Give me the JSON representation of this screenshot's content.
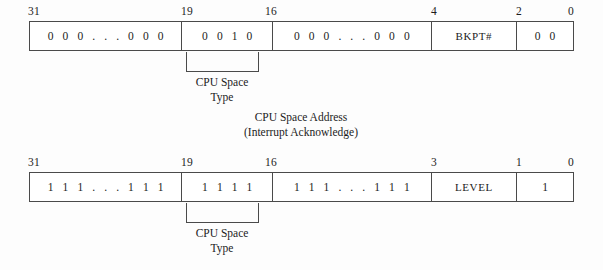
{
  "diagram": {
    "rows": [
      {
        "id": "interrupt-acknowledge",
        "bit_labels": [
          "31",
          "19",
          "16",
          "4",
          "2",
          "0"
        ],
        "fields": [
          {
            "name": "upper-zeros",
            "text": "0 0 0 . . . 0 0 0",
            "kind": "bits"
          },
          {
            "name": "cpu-space-type",
            "text": "0 0 1 0",
            "kind": "bits"
          },
          {
            "name": "middle-zeros",
            "text": "0 0 0 . . . 0 0 0",
            "kind": "bits"
          },
          {
            "name": "bkpt-number",
            "text": "BKPT#",
            "kind": "name"
          },
          {
            "name": "lower-zeros",
            "text": "0 0",
            "kind": "bits"
          }
        ],
        "bracket_label_line1": "CPU Space",
        "bracket_label_line2": "Type"
      },
      {
        "id": "interrupt-level",
        "bit_labels": [
          "31",
          "19",
          "16",
          "3",
          "1",
          "0"
        ],
        "fields": [
          {
            "name": "upper-ones",
            "text": "1 1 1 . . . 1 1 1",
            "kind": "bits"
          },
          {
            "name": "cpu-space-type",
            "text": "1 1 1 1",
            "kind": "bits"
          },
          {
            "name": "middle-ones",
            "text": "1 1 1 . . . 1 1 1",
            "kind": "bits"
          },
          {
            "name": "level",
            "text": "LEVEL",
            "kind": "name"
          },
          {
            "name": "lower-one",
            "text": "1",
            "kind": "bits"
          }
        ],
        "bracket_label_line1": "CPU Space",
        "bracket_label_line2": "Type"
      }
    ],
    "center_caption_line1": "CPU Space Address",
    "center_caption_line2": "(Interrupt Acknowledge)"
  }
}
